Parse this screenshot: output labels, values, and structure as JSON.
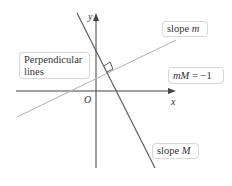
{
  "diagram": {
    "title": "Perpendicular lines",
    "axes": {
      "x_label": "x",
      "y_label": "y",
      "origin_label": "O"
    },
    "lines": [
      {
        "name": "slope m",
        "label_prefix": "slope ",
        "label_var": "m",
        "color": "#a8a8a8"
      },
      {
        "name": "slope M",
        "label_prefix": "slope ",
        "label_var": "M",
        "color": "#555555"
      }
    ],
    "boxes": {
      "perpendicular_line1": "Perpendicular",
      "perpendicular_line2": "lines",
      "equation_lhs": "mM",
      "equation_eq": " = ",
      "equation_rhs": "−1"
    },
    "colors": {
      "axis": "#444444",
      "steep_line": "#555555",
      "shallow_line": "#b0b0b0",
      "box_border": "#d8d8d8",
      "text": "#333333"
    }
  }
}
